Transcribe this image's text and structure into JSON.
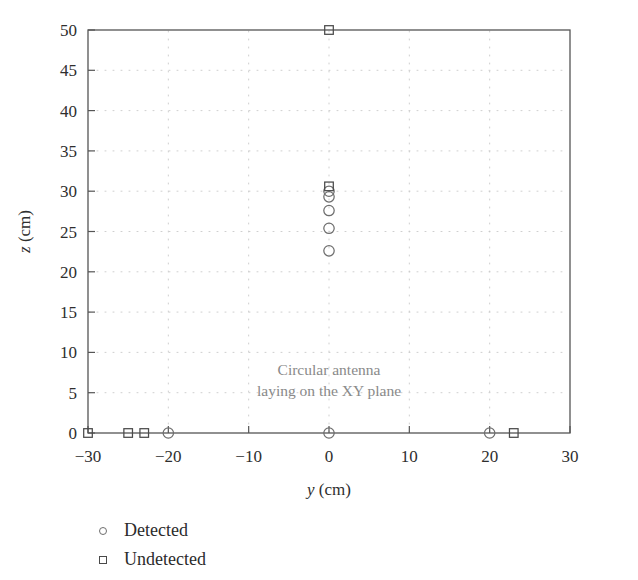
{
  "chart_data": {
    "type": "scatter",
    "title": "",
    "xlabel": "y (cm)",
    "xlabel_symbol": "y",
    "xlabel_unit": "(cm)",
    "ylabel": "z (cm)",
    "ylabel_symbol": "z",
    "ylabel_unit": "(cm)",
    "xlim": [
      -30,
      30
    ],
    "ylim": [
      0,
      50
    ],
    "xticks": [
      -30,
      -20,
      -10,
      0,
      10,
      20,
      30
    ],
    "xtick_labels": [
      "−30",
      "−20",
      "−10",
      "0",
      "10",
      "20",
      "30"
    ],
    "yticks": [
      0,
      5,
      10,
      15,
      20,
      25,
      30,
      35,
      40,
      45,
      50
    ],
    "ytick_labels": [
      "0",
      "5",
      "10",
      "15",
      "20",
      "25",
      "30",
      "35",
      "40",
      "45",
      "50"
    ],
    "grid": true,
    "grid_style": "dotted",
    "grid_color": "#c9c9c9",
    "frame_color": "#555555",
    "legend_position": "below-axes-left",
    "annotations": [
      {
        "name": "antenna-note",
        "lines": [
          "Circular antenna",
          "laying on the XY plane"
        ],
        "x": 0,
        "y": 7.2,
        "color": "#8a8a8a",
        "align": "center"
      }
    ],
    "series": [
      {
        "name": "Detected",
        "marker": "circle",
        "color": "#6e6e6e",
        "points": [
          {
            "x": -20.0,
            "y": 0.0
          },
          {
            "x": 0.0,
            "y": 0.0
          },
          {
            "x": 20.0,
            "y": 0.0
          },
          {
            "x": 0.0,
            "y": 22.6
          },
          {
            "x": 0.0,
            "y": 25.4
          },
          {
            "x": 0.0,
            "y": 27.6
          },
          {
            "x": 0.0,
            "y": 29.3
          },
          {
            "x": 0.0,
            "y": 30.0
          }
        ]
      },
      {
        "name": "Undetected",
        "marker": "square",
        "color": "#4a4a4a",
        "points": [
          {
            "x": -30.0,
            "y": 0.0
          },
          {
            "x": -25.0,
            "y": 0.0
          },
          {
            "x": -23.0,
            "y": 0.0
          },
          {
            "x": 23.0,
            "y": 0.0
          },
          {
            "x": 0.0,
            "y": 30.6
          },
          {
            "x": 0.0,
            "y": 50.0
          }
        ]
      }
    ]
  },
  "legend": {
    "items": [
      {
        "marker": "circle",
        "label": "Detected"
      },
      {
        "marker": "square",
        "label": "Undetected"
      }
    ]
  }
}
